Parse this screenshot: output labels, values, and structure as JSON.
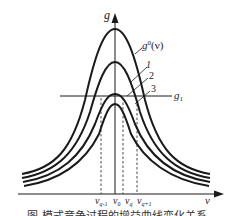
{
  "axes": {
    "y_label": "g",
    "x_label": "ν"
  },
  "threshold": {
    "label": "g",
    "subscript": "1"
  },
  "curves": [
    {
      "id": "g0",
      "label": "g",
      "superscript": "0",
      "suffix": "(ν)"
    },
    {
      "id": "c1",
      "label": "1"
    },
    {
      "id": "c2",
      "label": "2"
    },
    {
      "id": "c3",
      "label": "3"
    }
  ],
  "frequencies": [
    {
      "base": "ν",
      "sub": "q-1"
    },
    {
      "base": "ν",
      "sub": "0"
    },
    {
      "base": "ν",
      "sub": "q"
    },
    {
      "base": "ν",
      "sub": "q+1"
    }
  ],
  "caption": "图 模式竞争过程的增益曲线变化关系",
  "colors": {
    "line": "#1a1a1a",
    "text": "#222222"
  }
}
